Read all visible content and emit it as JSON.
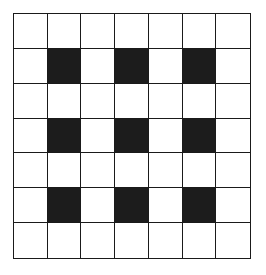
{
  "grid": {
    "rows": 7,
    "cols": 7,
    "line_color": "#1a1a1a",
    "fill_color": "#1c1c1c",
    "empty_color": "#ffffff",
    "filled_cells": [
      [
        1,
        1
      ],
      [
        1,
        3
      ],
      [
        1,
        5
      ],
      [
        3,
        1
      ],
      [
        3,
        3
      ],
      [
        3,
        5
      ],
      [
        5,
        1
      ],
      [
        5,
        3
      ],
      [
        5,
        5
      ]
    ]
  }
}
